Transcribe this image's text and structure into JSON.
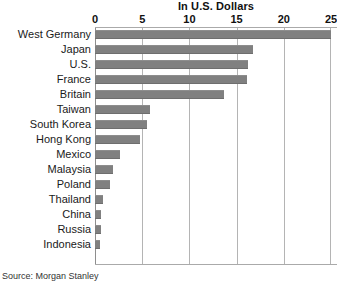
{
  "chart_data": {
    "type": "bar",
    "orientation": "horizontal",
    "title": "In U.S. Dollars",
    "xlabel": "",
    "ylabel": "",
    "xlim": [
      0,
      25
    ],
    "xticks": [
      0,
      5,
      10,
      15,
      20,
      25
    ],
    "xtick_labels": [
      "0",
      "5",
      "10",
      "15",
      "20",
      "25"
    ],
    "grid": true,
    "legend": "none",
    "bar_color": "#808080",
    "categories": [
      "West Germany",
      "Japan",
      "U.S.",
      "France",
      "Britain",
      "Taiwan",
      "South Korea",
      "Hong Kong",
      "Mexico",
      "Malaysia",
      "Poland",
      "Thailand",
      "China",
      "Russia",
      "Indonesia"
    ],
    "values": [
      25.0,
      16.7,
      16.2,
      16.1,
      13.7,
      5.8,
      5.5,
      4.8,
      2.6,
      1.9,
      1.6,
      0.8,
      0.6,
      0.6,
      0.5
    ],
    "source": "Source: Morgan Stanley"
  }
}
